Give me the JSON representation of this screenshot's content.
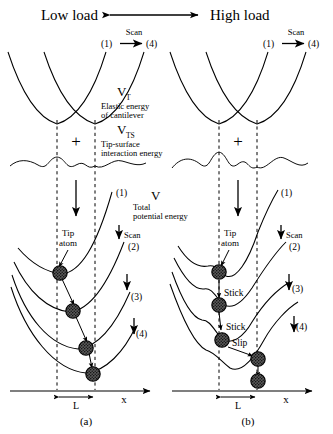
{
  "figure": {
    "header": {
      "low_load": "Low load",
      "high_load": "High load",
      "arrow_icon": "double-headed-arrow"
    },
    "scan_markers": {
      "start": "(1)",
      "end": "(4)",
      "scan_label": "Scan"
    },
    "energy_terms": [
      {
        "symbol": "V",
        "subscript": "T",
        "description_line1": "Elastic energy",
        "description_line2": "of cantilever"
      },
      {
        "symbol": "V",
        "subscript": "TS",
        "description_line1": "Tip-surface",
        "description_line2": "interaction energy"
      },
      {
        "symbol": "V",
        "subscript": "",
        "description_line1": "Total",
        "description_line2": "potential energy"
      }
    ],
    "plus_operator": "+",
    "curve_labels": [
      "(1)",
      "(2)",
      "(3)",
      "(4)"
    ],
    "annotations": {
      "tip_atom_line1": "Tip",
      "tip_atom_line2": "atom",
      "scan_label": "Scan",
      "stick": "Stick",
      "slip": "Slip"
    },
    "axis": {
      "x_label": "x",
      "lattice_label": "L"
    },
    "panels": [
      {
        "id": "a",
        "label": "(a)",
        "regime": "Low load",
        "motion": "continuous sliding",
        "stick_labels": []
      },
      {
        "id": "b",
        "label": "(b)",
        "regime": "High load",
        "motion": "stick-slip",
        "stick_labels": [
          "Stick",
          "Stick",
          "Slip"
        ]
      }
    ],
    "colors": {
      "ink": "#000000",
      "background": "#ffffff",
      "atom_fill": "#3a3a3a"
    }
  }
}
